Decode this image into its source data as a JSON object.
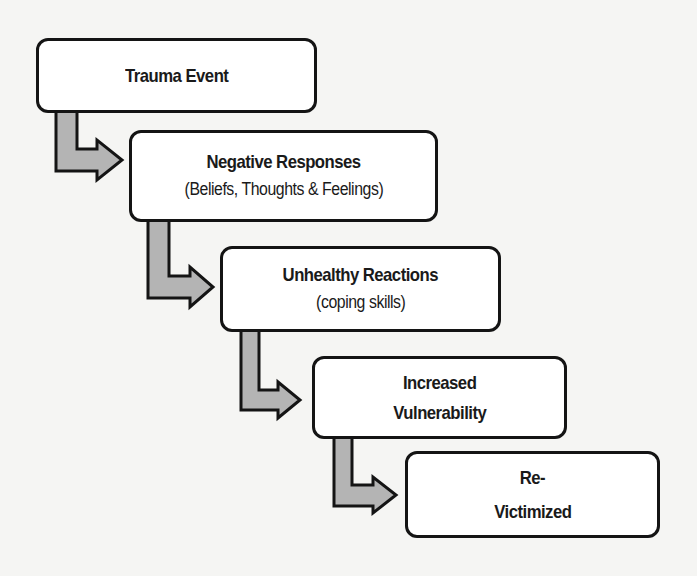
{
  "diagram": {
    "type": "cascading-flow",
    "colors": {
      "box_fill": "#ffffff",
      "box_border": "#141414",
      "arrow_fill": "#b4b4b4",
      "arrow_border": "#141414",
      "text": "#1a1a1a"
    },
    "steps": [
      {
        "title": "Trauma Event",
        "subtitle": null
      },
      {
        "title": "Negative Responses",
        "subtitle": "(Beliefs, Thoughts & Feelings)"
      },
      {
        "title": "Unhealthy Reactions",
        "subtitle": "(coping skills)"
      },
      {
        "title": "Increased",
        "subtitle_title": "Vulnerability"
      },
      {
        "title": "Re-",
        "subtitle_title": "Victimized"
      }
    ],
    "connections": [
      {
        "from": 0,
        "to": 1,
        "icon": "elbow-arrow-icon"
      },
      {
        "from": 1,
        "to": 2,
        "icon": "elbow-arrow-icon"
      },
      {
        "from": 2,
        "to": 3,
        "icon": "elbow-arrow-icon"
      },
      {
        "from": 3,
        "to": 4,
        "icon": "elbow-arrow-icon"
      }
    ]
  }
}
